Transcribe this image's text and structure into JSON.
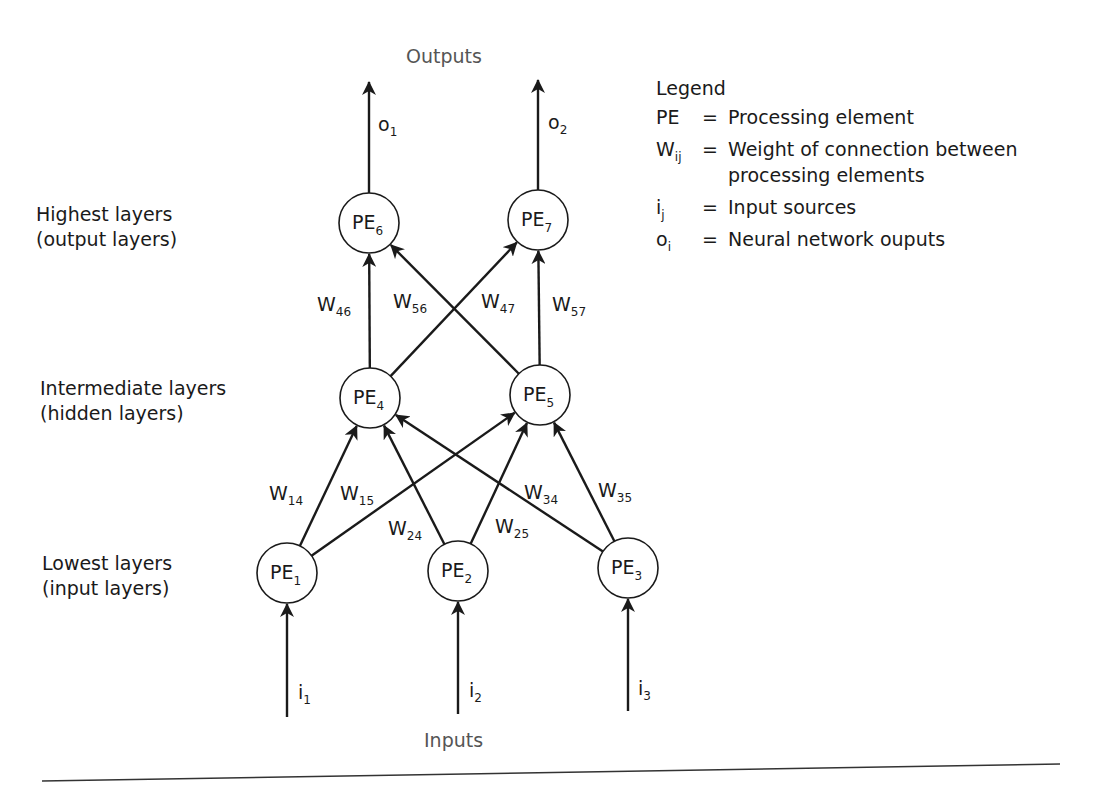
{
  "diagram": {
    "title_top": "Outputs",
    "title_bottom": "Inputs",
    "layer_labels": [
      {
        "line1": "Highest layers",
        "line2": "(output layers)"
      },
      {
        "line1": "Intermediate layers",
        "line2": "(hidden layers)"
      },
      {
        "line1": "Lowest layers",
        "line2": "(input layers)"
      }
    ],
    "nodes": [
      {
        "id": "PE1",
        "base": "PE",
        "sub": "1",
        "layer": "input"
      },
      {
        "id": "PE2",
        "base": "PE",
        "sub": "2",
        "layer": "input"
      },
      {
        "id": "PE3",
        "base": "PE",
        "sub": "3",
        "layer": "input"
      },
      {
        "id": "PE4",
        "base": "PE",
        "sub": "4",
        "layer": "hidden"
      },
      {
        "id": "PE5",
        "base": "PE",
        "sub": "5",
        "layer": "hidden"
      },
      {
        "id": "PE6",
        "base": "PE",
        "sub": "6",
        "layer": "output"
      },
      {
        "id": "PE7",
        "base": "PE",
        "sub": "7",
        "layer": "output"
      }
    ],
    "edges": [
      {
        "from": "PE1",
        "to": "PE4",
        "base": "W",
        "sub": "14"
      },
      {
        "from": "PE1",
        "to": "PE5",
        "base": "W",
        "sub": "15"
      },
      {
        "from": "PE2",
        "to": "PE4",
        "base": "W",
        "sub": "24"
      },
      {
        "from": "PE2",
        "to": "PE5",
        "base": "W",
        "sub": "25"
      },
      {
        "from": "PE3",
        "to": "PE4",
        "base": "W",
        "sub": "34"
      },
      {
        "from": "PE3",
        "to": "PE5",
        "base": "W",
        "sub": "35"
      },
      {
        "from": "PE4",
        "to": "PE6",
        "base": "W",
        "sub": "46"
      },
      {
        "from": "PE4",
        "to": "PE7",
        "base": "W",
        "sub": "47"
      },
      {
        "from": "PE5",
        "to": "PE6",
        "base": "W",
        "sub": "56"
      },
      {
        "from": "PE5",
        "to": "PE7",
        "base": "W",
        "sub": "57"
      }
    ],
    "inputs": [
      {
        "base": "i",
        "sub": "1",
        "to": "PE1"
      },
      {
        "base": "i",
        "sub": "2",
        "to": "PE2"
      },
      {
        "base": "i",
        "sub": "3",
        "to": "PE3"
      }
    ],
    "outputs": [
      {
        "base": "o",
        "sub": "1",
        "from": "PE6"
      },
      {
        "base": "o",
        "sub": "2",
        "from": "PE7"
      }
    ]
  },
  "legend": {
    "title": "Legend",
    "entries": [
      {
        "sym_base": "PE",
        "sym_sub": "",
        "eq": "=",
        "def_line1": "Processing element",
        "def_line2": ""
      },
      {
        "sym_base": "W",
        "sym_sub": "ij",
        "eq": "=",
        "def_line1": "Weight of connection between",
        "def_line2": "processing elements"
      },
      {
        "sym_base": "i",
        "sym_sub": "j",
        "eq": "=",
        "def_line1": "Input sources",
        "def_line2": ""
      },
      {
        "sym_base": "o",
        "sym_sub": "i",
        "eq": "=",
        "def_line1": "Neural network ouputs",
        "def_line2": ""
      }
    ]
  },
  "colors": {
    "ink": "#1a1a1a",
    "caption_gray": "#555555",
    "background": "#ffffff"
  }
}
